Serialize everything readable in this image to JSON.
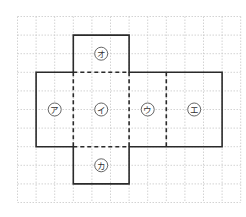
{
  "diagram": {
    "type": "cube-net",
    "grid": {
      "cols": 12,
      "rows": 10,
      "origin_x": 17.5,
      "origin_y": 16.5,
      "cell": 18.6,
      "color": "#c8c8c8"
    },
    "colors": {
      "edge": "#2a2a2a",
      "circle": "#555555",
      "text": "#333333"
    },
    "faces": [
      {
        "id": "a",
        "label": "ア",
        "col": 1,
        "row": 3,
        "w": 2,
        "h": 4
      },
      {
        "id": "i",
        "label": "イ",
        "col": 3,
        "row": 3,
        "w": 3,
        "h": 4
      },
      {
        "id": "u",
        "label": "ウ",
        "col": 6,
        "row": 3,
        "w": 2,
        "h": 4
      },
      {
        "id": "e",
        "label": "エ",
        "col": 8,
        "row": 3,
        "w": 3,
        "h": 4
      },
      {
        "id": "o",
        "label": "オ",
        "col": 3,
        "row": 1,
        "w": 3,
        "h": 2
      },
      {
        "id": "ka",
        "label": "カ",
        "col": 3,
        "row": 7,
        "w": 3,
        "h": 2
      }
    ]
  }
}
